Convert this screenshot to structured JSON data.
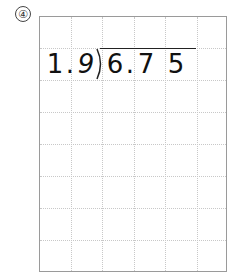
{
  "problem_number": "④",
  "divisor": [
    "1",
    ".",
    "9"
  ],
  "dividend": [
    "6",
    ".",
    "7",
    "5"
  ],
  "grid": {
    "columns": 6,
    "rows": 8
  }
}
